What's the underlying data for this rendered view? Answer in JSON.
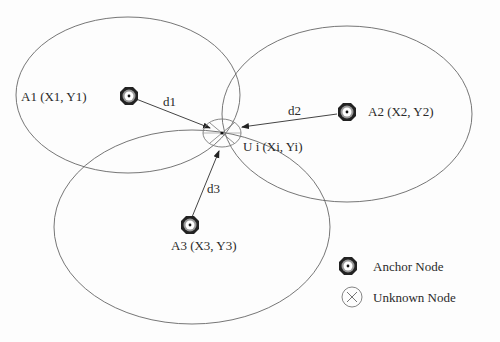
{
  "diagram": {
    "anchors": [
      {
        "id": "A1",
        "label": "A1 (X1, Y1)",
        "distance_label": "d1"
      },
      {
        "id": "A2",
        "label": "A2 (X2, Y2)",
        "distance_label": "d2"
      },
      {
        "id": "A3",
        "label": "A3 (X3, Y3)",
        "distance_label": "d3"
      }
    ],
    "unknown": {
      "id": "U",
      "label": "U i (Xi, Yi)"
    },
    "legend": {
      "anchor": "Anchor Node",
      "unknown": "Unknown Node"
    },
    "colors": {
      "line": "#555555",
      "node": "#1a1a1a",
      "text": "#2a2a2a"
    }
  }
}
